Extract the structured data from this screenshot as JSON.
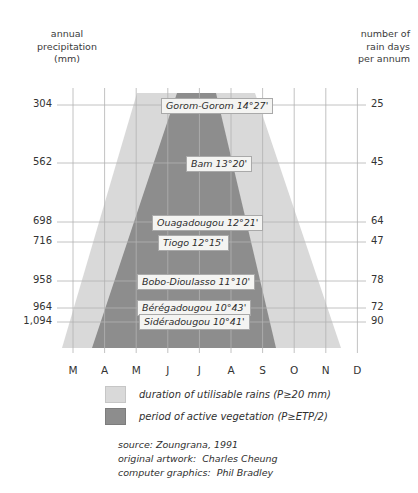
{
  "header": {
    "left_title": "annual\nprecipitation\n(mm)",
    "right_title": "number of\nrain days\nper annum"
  },
  "axes": {
    "left_values": [
      "304",
      "562",
      "698",
      "716",
      "958",
      "964",
      "1,094"
    ],
    "right_values": [
      "25",
      "45",
      "64",
      "47",
      "78",
      "72",
      "90"
    ],
    "months": [
      "M",
      "A",
      "M",
      "J",
      "J",
      "A",
      "S",
      "O",
      "N",
      "D"
    ]
  },
  "stations": [
    {
      "label": "Gorom-Gorom 14°27'",
      "precip": "304",
      "raindays": "25"
    },
    {
      "label": "Bam 13°20'",
      "precip": "562",
      "raindays": "45"
    },
    {
      "label": "Ouagadougou 12°21'",
      "precip": "698",
      "raindays": "64"
    },
    {
      "label": "Tiogo 12°15'",
      "precip": "716",
      "raindays": "47"
    },
    {
      "label": "Bobo-Dioulasso 11°10'",
      "precip": "958",
      "raindays": "78"
    },
    {
      "label": "Bérégadougou 10°43'",
      "precip": "964",
      "raindays": "72"
    },
    {
      "label": "Sidéradougou 10°41'",
      "precip": "1,094",
      "raindays": "90"
    }
  ],
  "legend": [
    {
      "swatch": "light",
      "text": "duration of utilisable rains (P≥20 mm)"
    },
    {
      "swatch": "dark",
      "text": "period of active vegetation (P≥ETP/2)"
    }
  ],
  "credits": [
    "source: Zoungrana, 1991",
    "original artwork:  Charles Cheung",
    "computer graphics:  Phil Bradley"
  ],
  "colors": {
    "light_band": "#d9d9d9",
    "dark_band": "#8d8d8d",
    "gridline": "#b2b2b2",
    "text": "#303030"
  },
  "chart_data": {
    "type": "area",
    "xlabel": "",
    "ylabel": "annual precipitation (mm)",
    "x": [
      "M",
      "A",
      "M",
      "J",
      "J",
      "A",
      "S",
      "O",
      "N",
      "D"
    ],
    "grid": true,
    "legend_position": "below-plot",
    "rows": [
      {
        "station": "Gorom-Gorom",
        "latitude": "14°27'",
        "annual_precipitation_mm": 304,
        "rain_days_per_annum": 25,
        "utilisable_rains_start_month": "Jun",
        "utilisable_rains_end_month": "Sep",
        "active_vegetation_start_month": "Jul",
        "active_vegetation_end_month": "Aug"
      },
      {
        "station": "Bam",
        "latitude": "13°20'",
        "annual_precipitation_mm": 562,
        "rain_days_per_annum": 45,
        "utilisable_rains_start_month": "May",
        "utilisable_rains_end_month": "Oct",
        "active_vegetation_start_month": "Jun",
        "active_vegetation_end_month": "Sep"
      },
      {
        "station": "Ouagadougou",
        "latitude": "12°21'",
        "annual_precipitation_mm": 698,
        "rain_days_per_annum": 64,
        "utilisable_rains_start_month": "May",
        "utilisable_rains_end_month": "Oct",
        "active_vegetation_start_month": "Jun",
        "active_vegetation_end_month": "Sep"
      },
      {
        "station": "Tiogo",
        "latitude": "12°15'",
        "annual_precipitation_mm": 716,
        "rain_days_per_annum": 47,
        "utilisable_rains_start_month": "Apr",
        "utilisable_rains_end_month": "Oct",
        "active_vegetation_start_month": "May",
        "active_vegetation_end_month": "Sep"
      },
      {
        "station": "Bobo-Dioulasso",
        "latitude": "11°10'",
        "annual_precipitation_mm": 958,
        "rain_days_per_annum": 78,
        "utilisable_rains_start_month": "Apr",
        "utilisable_rains_end_month": "Nov",
        "active_vegetation_start_month": "Apr",
        "active_vegetation_end_month": "Oct"
      },
      {
        "station": "Bérégadougou",
        "latitude": "10°43'",
        "annual_precipitation_mm": 964,
        "rain_days_per_annum": 72,
        "utilisable_rains_start_month": "Mar",
        "utilisable_rains_end_month": "Nov",
        "active_vegetation_start_month": "Apr",
        "active_vegetation_end_month": "Oct"
      },
      {
        "station": "Sidéradougou",
        "latitude": "10°41'",
        "annual_precipitation_mm": 1094,
        "rain_days_per_annum": 90,
        "utilisable_rains_start_month": "Mar",
        "utilisable_rains_end_month": "Nov",
        "active_vegetation_start_month": "Mar",
        "active_vegetation_end_month": "Oct"
      }
    ],
    "series": [
      {
        "name": "duration of utilisable rains (P≥20 mm)",
        "color": "#d9d9d9",
        "polygon_top_left_x": 137,
        "polygon_top_right_x": 255,
        "polygon_bottom_left_x": 62,
        "polygon_bottom_right_x": 341
      },
      {
        "name": "period of active vegetation (P≥ETP/2)",
        "color": "#8d8d8d",
        "polygon_top_left_x": 177,
        "polygon_top_right_x": 216,
        "polygon_bottom_left_x": 92,
        "polygon_bottom_right_x": 276
      }
    ]
  }
}
